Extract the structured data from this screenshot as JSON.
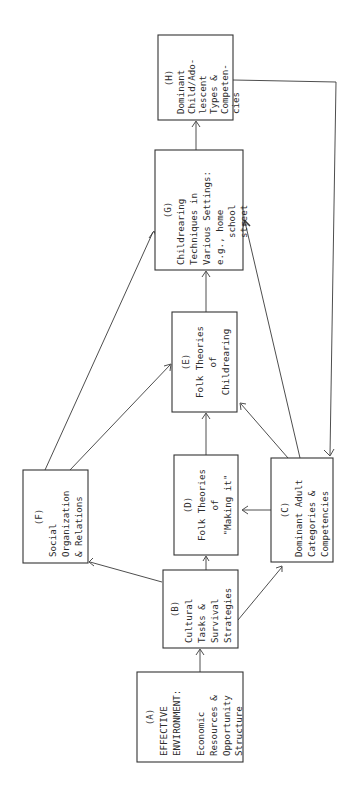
{
  "diagram": {
    "orientation": "rotated -90deg (reads bottom to top)",
    "nodes": [
      {
        "id": "A",
        "label": "(A)",
        "lines": [
          "EFFECTIVE",
          "ENVIRONMENT:",
          "",
          "Economic",
          "Resources &",
          "Opportunity",
          "Structure"
        ]
      },
      {
        "id": "B",
        "label": "(B)",
        "lines": [
          "Cultural",
          "Tasks &",
          "Survival",
          "Strategies"
        ]
      },
      {
        "id": "C",
        "label": "(C)",
        "lines": [
          "Dominant Adult",
          "Categories &",
          "Competencies"
        ]
      },
      {
        "id": "D",
        "label": "(D)",
        "lines": [
          "Folk Theories",
          "of",
          "\"Making it\""
        ]
      },
      {
        "id": "E",
        "label": "(E)",
        "lines": [
          "Folk Theories",
          "of",
          "Childrearing"
        ]
      },
      {
        "id": "F",
        "label": "(F)",
        "lines": [
          "Social",
          "Organization",
          "& Relations"
        ]
      },
      {
        "id": "G",
        "label": "(G)",
        "lines": [
          "Childrearing",
          "Techniques in",
          "Various Settings:",
          "e.g., home",
          "school",
          "street"
        ]
      },
      {
        "id": "H",
        "label": "(H)",
        "lines": [
          "Dominant",
          "Child/Ado-",
          "lescent",
          "Types &",
          "Competen-",
          "cies"
        ]
      }
    ],
    "edges": [
      {
        "from": "A",
        "to": "B"
      },
      {
        "from": "B",
        "to": "F"
      },
      {
        "from": "B",
        "to": "D"
      },
      {
        "from": "B",
        "to": "C"
      },
      {
        "from": "C",
        "to": "D"
      },
      {
        "from": "C",
        "to": "E"
      },
      {
        "from": "C",
        "to": "G"
      },
      {
        "from": "D",
        "to": "E"
      },
      {
        "from": "F",
        "to": "E"
      },
      {
        "from": "F",
        "to": "G"
      },
      {
        "from": "E",
        "to": "G"
      },
      {
        "from": "G",
        "to": "H"
      },
      {
        "from": "H",
        "to": "C"
      }
    ]
  }
}
